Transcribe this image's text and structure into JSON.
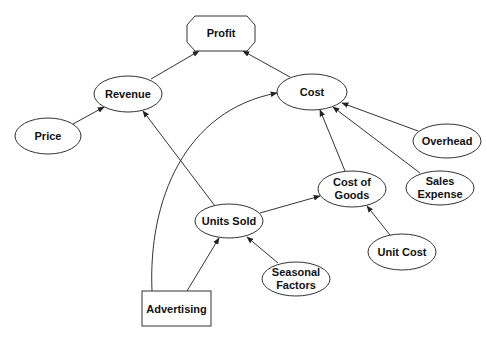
{
  "diagram": {
    "type": "influence-diagram",
    "nodes": {
      "profit": {
        "label": "Profit",
        "shape": "octagon"
      },
      "revenue": {
        "label": "Revenue",
        "shape": "ellipse"
      },
      "cost": {
        "label": "Cost",
        "shape": "ellipse"
      },
      "price": {
        "label": "Price",
        "shape": "ellipse"
      },
      "overhead": {
        "label": "Overhead",
        "shape": "ellipse"
      },
      "sales_expense": {
        "label_line1": "Sales",
        "label_line2": "Expense",
        "shape": "ellipse"
      },
      "cost_of_goods": {
        "label_line1": "Cost of",
        "label_line2": "Goods",
        "shape": "ellipse"
      },
      "units_sold": {
        "label": "Units Sold",
        "shape": "ellipse"
      },
      "unit_cost": {
        "label": "Unit Cost",
        "shape": "ellipse"
      },
      "seasonal_factors": {
        "label_line1": "Seasonal",
        "label_line2": "Factors",
        "shape": "ellipse"
      },
      "advertising": {
        "label": "Advertising",
        "shape": "rectangle"
      }
    },
    "edges": [
      {
        "from": "Revenue",
        "to": "Profit"
      },
      {
        "from": "Cost",
        "to": "Profit"
      },
      {
        "from": "Price",
        "to": "Revenue"
      },
      {
        "from": "Units Sold",
        "to": "Revenue"
      },
      {
        "from": "Advertising",
        "to": "Cost"
      },
      {
        "from": "Overhead",
        "to": "Cost"
      },
      {
        "from": "Sales Expense",
        "to": "Cost"
      },
      {
        "from": "Cost of Goods",
        "to": "Cost"
      },
      {
        "from": "Units Sold",
        "to": "Cost of Goods"
      },
      {
        "from": "Unit Cost",
        "to": "Cost of Goods"
      },
      {
        "from": "Advertising",
        "to": "Units Sold"
      },
      {
        "from": "Seasonal Factors",
        "to": "Units Sold"
      }
    ],
    "colors": {
      "stroke": "#333333",
      "fill": "#ffffff",
      "text": "#111111"
    }
  }
}
